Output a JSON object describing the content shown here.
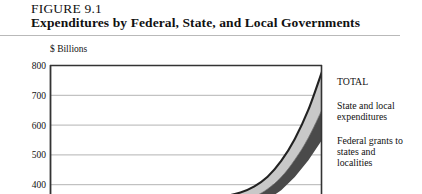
{
  "figure": {
    "label": "FIGURE 9.1",
    "title": "Expenditures by Federal, State, and Local Governments"
  },
  "chart_data": {
    "type": "area",
    "title": "Expenditures by Federal, State, and Local Governments",
    "subtitle": "FIGURE 9.1",
    "ylabel": "$ Billions",
    "xlabel": "",
    "ylim": [
      400,
      800
    ],
    "yticks": [
      800,
      700,
      600,
      500,
      400
    ],
    "ytick_labels": [
      "800",
      "700",
      "600",
      "500",
      "400"
    ],
    "grid": true,
    "legend_position": "right",
    "note": "Cropped view: only the upper portion of the plot is visible; curves rise steeply at the right edge.",
    "x": [
      0,
      10,
      20,
      30,
      40,
      50,
      60,
      70,
      75,
      80,
      85,
      90,
      95,
      100
    ],
    "series": [
      {
        "name": "TOTAL",
        "color": "#222222",
        "values": [
          318,
          320,
          323,
          327,
          332,
          340,
          352,
          372,
          392,
          425,
          478,
          552,
          650,
          778
        ]
      },
      {
        "name": "State and local expenditures",
        "color": "#c8c8c8",
        "values": [
          300,
          302,
          305,
          308,
          312,
          318,
          327,
          342,
          358,
          384,
          424,
          482,
          556,
          650
        ]
      },
      {
        "name": "Federal grants to states and localities",
        "color": "#4a4a4a",
        "values": [
          288,
          289,
          291,
          293,
          296,
          300,
          306,
          316,
          328,
          348,
          380,
          424,
          480,
          548
        ]
      }
    ],
    "legend": [
      {
        "label": "TOTAL",
        "swatch": "#222222"
      },
      {
        "label": "State and local\nexpenditures",
        "swatch": "#c8c8c8"
      },
      {
        "label": "Federal grants to\nstates and\nlocalities",
        "swatch": "#4a4a4a"
      }
    ]
  },
  "axis": {
    "unit_label": "$ Billions",
    "tick_800": "800",
    "tick_700": "700",
    "tick_600": "600",
    "tick_500": "500",
    "tick_400": "400"
  },
  "legend": {
    "total": "TOTAL",
    "state_local": "State and local\nexpenditures",
    "federal_grants": "Federal grants to\nstates and\nlocalities"
  },
  "colors": {
    "total_line": "#222222",
    "state_local_fill": "#c8c8c8",
    "federal_fill": "#4a4a4a",
    "frame": "#333333",
    "gridline": "#aaaaaa",
    "rule": "#b9b9b9"
  }
}
